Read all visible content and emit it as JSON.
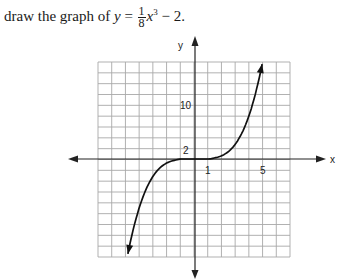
{
  "prompt": {
    "lead": "draw the graph of ",
    "var_y": "y",
    "equals": " = ",
    "frac_num": "1",
    "frac_den": "8",
    "var_x": "x",
    "exponent": "3",
    "tail": " − 2."
  },
  "graph": {
    "axis_x_label": "x",
    "axis_y_label": "y",
    "tick_labels": {
      "x_1": "1",
      "x_5": "5",
      "y_2": "2",
      "y_10": "10"
    }
  },
  "chart_data": {
    "type": "line",
    "xlabel": "x",
    "ylabel": "y",
    "grid": true,
    "x_grid_range_cells": [
      -7,
      7
    ],
    "y_grid_range_cells": [
      -9,
      9
    ],
    "labeled_ticks": {
      "x": [
        1,
        5
      ],
      "y": [
        2,
        10
      ]
    },
    "series": [
      {
        "name": "cubic curve (as drawn)",
        "points": [
          [
            -5,
            -16
          ],
          [
            -4,
            -9
          ],
          [
            -3,
            -4
          ],
          [
            -2,
            -1
          ],
          [
            -1,
            0
          ],
          [
            0,
            0
          ],
          [
            1,
            0
          ],
          [
            2,
            1
          ],
          [
            3,
            4
          ],
          [
            4,
            9
          ],
          [
            5,
            16
          ]
        ],
        "arrows_at_ends": true
      }
    ]
  }
}
